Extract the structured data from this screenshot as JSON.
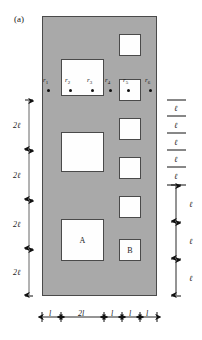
{
  "figure": {
    "panel_label": "(a)",
    "panel": {
      "fill_color": "#a9a9a9",
      "stroke_color": "#4a4a4a"
    },
    "inclusion_fill": "#fefefe"
  },
  "sensors": [
    {
      "id": "r1",
      "label": "r",
      "sub": "1",
      "x": 48,
      "y": 90,
      "label_x": 43,
      "label_y": 76
    },
    {
      "id": "r2",
      "label": "r",
      "sub": "2",
      "x": 70,
      "y": 90,
      "label_x": 65,
      "label_y": 76
    },
    {
      "id": "r3",
      "label": "r",
      "sub": "3",
      "x": 92,
      "y": 90,
      "label_x": 87,
      "label_y": 76
    },
    {
      "id": "r4",
      "label": "r",
      "sub": "4",
      "x": 110,
      "y": 90,
      "label_x": 105,
      "label_y": 76
    },
    {
      "id": "r5",
      "label": "r",
      "sub": "5",
      "x": 128,
      "y": 90,
      "label_x": 123,
      "label_y": 76
    },
    {
      "id": "r6",
      "label": "r",
      "sub": "6",
      "x": 150,
      "y": 90,
      "label_x": 145,
      "label_y": 76
    }
  ],
  "inclusions": [
    {
      "name": "left-square-top",
      "x": 61,
      "y": 59,
      "w": 43,
      "h": 37,
      "label": ""
    },
    {
      "name": "left-square-middle",
      "x": 61,
      "y": 132,
      "w": 43,
      "h": 40,
      "label": ""
    },
    {
      "name": "left-square-a",
      "x": 61,
      "y": 219,
      "w": 43,
      "h": 42,
      "label": "A"
    },
    {
      "name": "right-square-1",
      "x": 119,
      "y": 34,
      "w": 22,
      "h": 22,
      "label": ""
    },
    {
      "name": "right-square-2",
      "x": 119,
      "y": 79,
      "w": 22,
      "h": 22,
      "label": ""
    },
    {
      "name": "right-square-3",
      "x": 119,
      "y": 118,
      "w": 22,
      "h": 22,
      "label": ""
    },
    {
      "name": "right-square-4",
      "x": 119,
      "y": 157,
      "w": 22,
      "h": 22,
      "label": ""
    },
    {
      "name": "right-square-5",
      "x": 119,
      "y": 196,
      "w": 22,
      "h": 22,
      "label": ""
    },
    {
      "name": "right-square-b",
      "x": 119,
      "y": 239,
      "w": 22,
      "h": 22,
      "label": "B"
    }
  ],
  "left_dimensions": {
    "axis_x": 29,
    "ticks": [
      100,
      150,
      200,
      249,
      296
    ],
    "segments": [
      {
        "label": "2ℓ",
        "text_x": 13,
        "text_y": 121
      },
      {
        "label": "2ℓ",
        "text_x": 13,
        "text_y": 171
      },
      {
        "label": "2ℓ",
        "text_x": 13,
        "text_y": 220
      },
      {
        "label": "2ℓ",
        "text_x": 13,
        "text_y": 268
      }
    ]
  },
  "right_dimensions": {
    "rule_x_start": 167,
    "rule_x_end": 186,
    "rules": [
      100,
      116,
      133,
      150,
      167,
      185
    ],
    "rule_labels": [
      {
        "label": "ℓ",
        "text_x": 174,
        "text_y": 104
      },
      {
        "label": "ℓ",
        "text_x": 174,
        "text_y": 121
      },
      {
        "label": "ℓ",
        "text_x": 174,
        "text_y": 138
      },
      {
        "label": "ℓ",
        "text_x": 174,
        "text_y": 155
      },
      {
        "label": "ℓ",
        "text_x": 174,
        "text_y": 172
      }
    ],
    "arrow_axis_x": 176,
    "arrow_ticks": [
      185,
      222,
      259,
      296
    ],
    "arrow_labels": [
      {
        "label": "ℓ",
        "text_x": 189,
        "text_y": 200
      },
      {
        "label": "ℓ",
        "text_x": 189,
        "text_y": 237
      },
      {
        "label": "ℓ",
        "text_x": 189,
        "text_y": 274
      }
    ]
  },
  "bottom_dimensions": {
    "axis_y": 317,
    "ticks": [
      42,
      61,
      104,
      122,
      140,
      157
    ],
    "segments": [
      {
        "label": "l",
        "text_x": 49,
        "text_y": 309
      },
      {
        "label": "2l",
        "text_x": 78,
        "text_y": 309
      },
      {
        "label": "l",
        "text_x": 111,
        "text_y": 309
      },
      {
        "label": "l",
        "text_x": 129,
        "text_y": 309
      },
      {
        "label": "l",
        "text_x": 146,
        "text_y": 309
      }
    ]
  }
}
